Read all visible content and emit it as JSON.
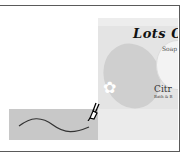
{
  "canvas": {
    "frame_color": "#5a5a5a",
    "background": "#ffffff"
  },
  "product_image": {
    "title": "Lots O'",
    "subtitle": "Soap",
    "brand": "Citr",
    "brand_sub": "Bath & B",
    "flower_glyph": "✿",
    "background": "#e4e4e4"
  },
  "stroke_swatch": {
    "background": "#c8c8c8",
    "stroke_color": "#333333"
  },
  "cursor": {
    "icon": "pen-brush-icon"
  }
}
